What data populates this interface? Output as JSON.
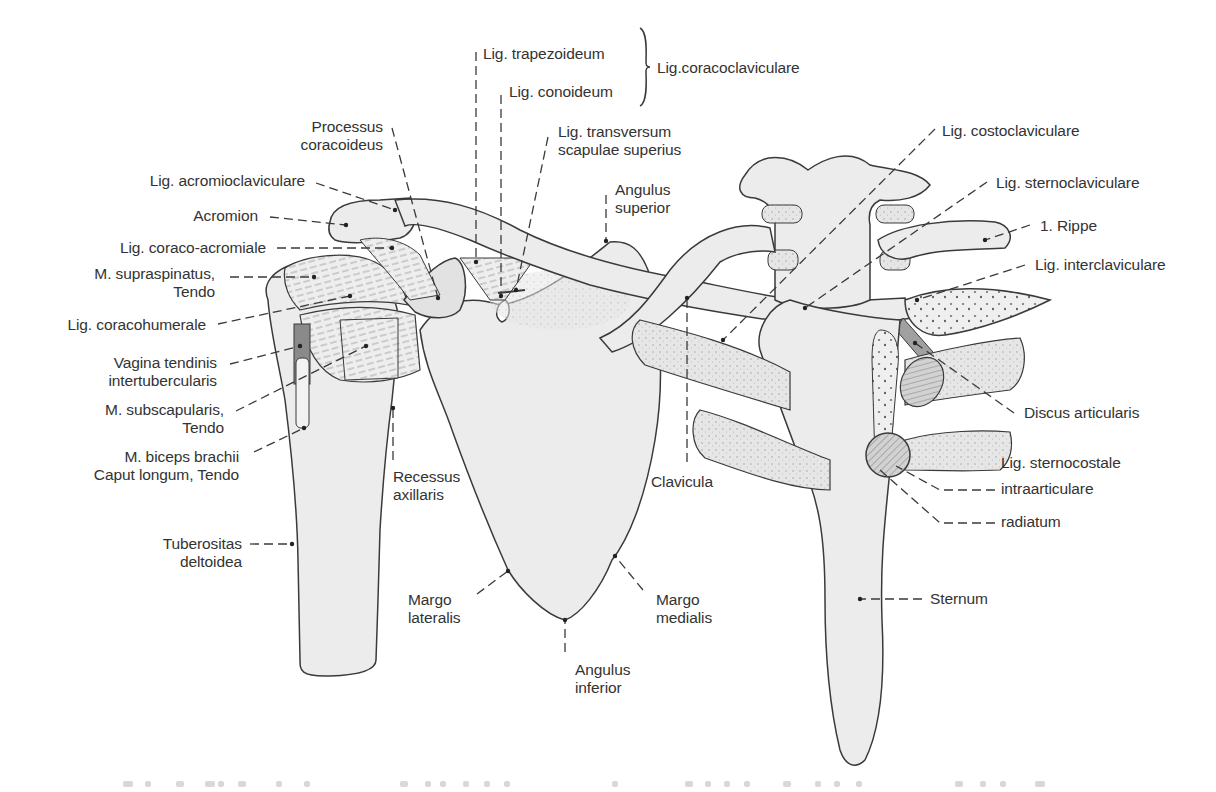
{
  "figure": {
    "colors": {
      "bone_fill": "#ececec",
      "bone_stroke": "#3a3a3a",
      "cartilage_fill": "#dcdcdc",
      "dark_fill": "#8a8a8a",
      "leader": "#3a3a3a",
      "text": "#333333"
    }
  },
  "labels": [
    {
      "id": "lig-trapezoideum",
      "text": "Lig. trapezoideum",
      "x": 483,
      "y": 45,
      "align": "left",
      "leader": [
        [
          476,
          52
        ],
        [
          476,
          262
        ]
      ],
      "dot": [
        476,
        262
      ]
    },
    {
      "id": "lig-conoideum",
      "text": "Lig. conoideum",
      "x": 509,
      "y": 83,
      "align": "left",
      "leader": [
        [
          501,
          95
        ],
        [
          501,
          296
        ]
      ],
      "dot": [
        501,
        296
      ]
    },
    {
      "id": "lig-coracoclaviculare",
      "text": "Lig.coracoclaviculare",
      "x": 657,
      "y": 59,
      "align": "left",
      "leader": [],
      "dot": null
    },
    {
      "id": "lig-transversum",
      "text": "Lig. transversum\nscapulae superius",
      "x": 558,
      "y": 123,
      "align": "left",
      "leader": [
        [
          548,
          137
        ],
        [
          516,
          290
        ]
      ],
      "dot": [
        516,
        290
      ]
    },
    {
      "id": "angulus-superior",
      "text": "Angulus\nsuperior",
      "x": 615,
      "y": 181,
      "align": "left",
      "leader": [
        [
          606,
          195
        ],
        [
          606,
          241
        ]
      ],
      "dot": [
        606,
        241
      ]
    },
    {
      "id": "processus-coracoideus",
      "text": "Processus\ncoracoideus",
      "x": 383,
      "y": 118,
      "align": "right",
      "leader": [
        [
          392,
          128
        ],
        [
          438,
          298
        ]
      ],
      "dot": [
        438,
        298
      ]
    },
    {
      "id": "lig-acromioclaviculare",
      "text": "Lig. acromioclaviculare",
      "x": 305,
      "y": 172,
      "align": "right",
      "leader": [
        [
          316,
          183
        ],
        [
          395,
          210
        ]
      ],
      "dot": [
        395,
        210
      ]
    },
    {
      "id": "acromion",
      "text": "Acromion",
      "x": 258,
      "y": 207,
      "align": "right",
      "leader": [
        [
          270,
          217
        ],
        [
          346,
          225
        ]
      ],
      "dot": [
        346,
        225
      ]
    },
    {
      "id": "lig-coraco-acromiale",
      "text": "Lig. coraco-acromiale",
      "x": 266,
      "y": 239,
      "align": "right",
      "leader": [
        [
          277,
          248
        ],
        [
          392,
          248
        ]
      ],
      "dot": [
        392,
        248
      ]
    },
    {
      "id": "m-supraspinatus",
      "text": "M. supraspinatus,\nTendo",
      "x": 215,
      "y": 265,
      "align": "right",
      "leader": [
        [
          230,
          277
        ],
        [
          314,
          277
        ]
      ],
      "dot": [
        314,
        277
      ]
    },
    {
      "id": "lig-coracohumerale",
      "text": "Lig. coracohumerale",
      "x": 206,
      "y": 316,
      "align": "right",
      "leader": [
        [
          218,
          324
        ],
        [
          350,
          296
        ]
      ],
      "dot": [
        350,
        296
      ]
    },
    {
      "id": "vagina-tendinis",
      "text": "Vagina tendinis\nintertubercularis",
      "x": 217,
      "y": 354,
      "align": "right",
      "leader": [
        [
          230,
          364
        ],
        [
          300,
          346
        ]
      ],
      "dot": [
        300,
        346
      ]
    },
    {
      "id": "m-subscapularis",
      "text": "M. subscapularis,\nTendo",
      "x": 224,
      "y": 401,
      "align": "right",
      "leader": [
        [
          236,
          411
        ],
        [
          366,
          346
        ]
      ],
      "dot": [
        366,
        346
      ]
    },
    {
      "id": "m-biceps-brachii",
      "text": "M. biceps brachii\nCaput longum, Tendo",
      "x": 239,
      "y": 448,
      "align": "right",
      "leader": [
        [
          254,
          452
        ],
        [
          304,
          428
        ]
      ],
      "dot": [
        304,
        428
      ]
    },
    {
      "id": "tuberositas-deltoidea",
      "text": "Tuberositas\ndeltoidea",
      "x": 242,
      "y": 535,
      "align": "right",
      "leader": [
        [
          250,
          544
        ],
        [
          292,
          544
        ]
      ],
      "dot": [
        292,
        544
      ]
    },
    {
      "id": "recessus-axillaris",
      "text": "Recessus\naxillaris",
      "x": 393,
      "y": 468,
      "align": "left",
      "leader": [
        [
          393,
          460
        ],
        [
          393,
          408
        ]
      ],
      "dot": [
        393,
        408
      ]
    },
    {
      "id": "margo-lateralis",
      "text": "Margo\nlateralis",
      "x": 408,
      "y": 591,
      "align": "left",
      "leader": [
        [
          477,
          594
        ],
        [
          508,
          571
        ]
      ],
      "dot": [
        508,
        571
      ]
    },
    {
      "id": "margo-medialis",
      "text": "Margo\nmedialis",
      "x": 656,
      "y": 591,
      "align": "left",
      "leader": [
        [
          643,
          590
        ],
        [
          615,
          556
        ]
      ],
      "dot": [
        615,
        556
      ]
    },
    {
      "id": "angulus-inferior",
      "text": "Angulus\ninferior",
      "x": 575,
      "y": 661,
      "align": "left",
      "leader": [
        [
          565,
          652
        ],
        [
          565,
          620
        ]
      ],
      "dot": [
        565,
        620
      ]
    },
    {
      "id": "clavicula",
      "text": "Clavicula",
      "x": 651,
      "y": 473,
      "align": "left",
      "leader": [
        [
          687,
          462
        ],
        [
          687,
          298
        ]
      ],
      "dot": [
        687,
        298
      ]
    },
    {
      "id": "lig-costoclaviculare",
      "text": "Lig. costoclaviculare",
      "x": 942,
      "y": 122,
      "align": "left",
      "leader": [
        [
          935,
          129
        ],
        [
          723,
          340
        ]
      ],
      "dot": [
        723,
        340
      ]
    },
    {
      "id": "lig-sternoclaviculare",
      "text": "Lig. sternoclaviculare",
      "x": 996,
      "y": 174,
      "align": "left",
      "leader": [
        [
          987,
          182
        ],
        [
          805,
          308
        ]
      ],
      "dot": [
        805,
        308
      ]
    },
    {
      "id": "rippe-1",
      "text": "1. Rippe",
      "x": 1040,
      "y": 217,
      "align": "left",
      "leader": [
        [
          1030,
          225
        ],
        [
          985,
          240
        ]
      ],
      "dot": [
        985,
        240
      ]
    },
    {
      "id": "lig-interclaviculare",
      "text": "Lig. interclaviculare",
      "x": 1035,
      "y": 256,
      "align": "left",
      "leader": [
        [
          1025,
          265
        ],
        [
          917,
          300
        ]
      ],
      "dot": [
        917,
        300
      ]
    },
    {
      "id": "discus-articularis",
      "text": "Discus articularis",
      "x": 1024,
      "y": 404,
      "align": "left",
      "leader": [
        [
          1014,
          413
        ],
        [
          915,
          343
        ]
      ],
      "dot": [
        915,
        343
      ]
    },
    {
      "id": "lig-sternocostale",
      "text": "Lig. sternocostale",
      "x": 1001,
      "y": 454,
      "align": "left",
      "leader": [],
      "dot": null
    },
    {
      "id": "intraarticulare",
      "text": "intraarticulare",
      "x": 1001,
      "y": 480,
      "align": "left",
      "leader": [
        [
          995,
          490
        ],
        [
          940,
          490
        ],
        [
          896,
          466
        ]
      ],
      "dot": null
    },
    {
      "id": "radiatum",
      "text": "radiatum",
      "x": 1001,
      "y": 513,
      "align": "left",
      "leader": [
        [
          995,
          523
        ],
        [
          940,
          523
        ],
        [
          880,
          470
        ]
      ],
      "dot": null
    },
    {
      "id": "sternum",
      "text": "Sternum",
      "x": 930,
      "y": 590,
      "align": "left",
      "leader": [
        [
          922,
          599
        ],
        [
          860,
          599
        ]
      ],
      "dot": [
        860,
        599
      ]
    }
  ],
  "brace": {
    "x": 640,
    "y_top": 28,
    "y_bottom": 106,
    "tip_x": 650,
    "tip_y": 68
  },
  "caption": {
    "visible_text": "",
    "note": "cropped, illegible caption line at bottom edge",
    "dots": [
      [
        123,
        10
      ],
      [
        145,
        6
      ],
      [
        176,
        8
      ],
      [
        205,
        10
      ],
      [
        218,
        6
      ],
      [
        238,
        8
      ],
      [
        276,
        6
      ],
      [
        304,
        6
      ],
      [
        400,
        8
      ],
      [
        425,
        6
      ],
      [
        440,
        6
      ],
      [
        463,
        6
      ],
      [
        484,
        6
      ],
      [
        504,
        6
      ],
      [
        612,
        6
      ],
      [
        685,
        8
      ],
      [
        705,
        6
      ],
      [
        724,
        6
      ],
      [
        744,
        6
      ],
      [
        783,
        8
      ],
      [
        815,
        6
      ],
      [
        834,
        6
      ],
      [
        856,
        6
      ],
      [
        955,
        8
      ],
      [
        980,
        6
      ],
      [
        1000,
        6
      ],
      [
        1035,
        10
      ]
    ]
  }
}
